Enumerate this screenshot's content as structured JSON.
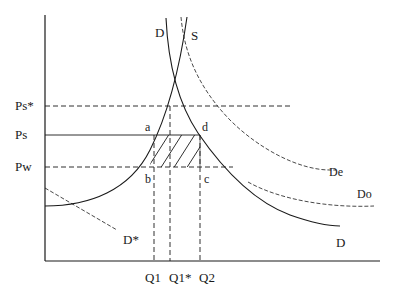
{
  "diagram": {
    "type": "supply-demand-economics",
    "axes": {
      "y_axis": {
        "x": 45,
        "top": 15,
        "bottom": 261
      },
      "x_axis": {
        "y": 261,
        "left": 45,
        "right": 380
      }
    },
    "price_labels": {
      "ps_star": "Ps*",
      "ps": "Ps",
      "pw": "Pw"
    },
    "quantity_labels": {
      "q1": "Q1",
      "q1_star": "Q1*",
      "q2": "Q2"
    },
    "curve_labels": {
      "d_top": "D",
      "s_top": "S",
      "de": "De",
      "do": "Do",
      "d_bottom": "D",
      "d_star": "D*"
    },
    "points": {
      "a": "a",
      "b": "b",
      "c": "c",
      "d": "d"
    },
    "colors": {
      "line": "#1a1a1a",
      "background": "#ffffff"
    }
  }
}
